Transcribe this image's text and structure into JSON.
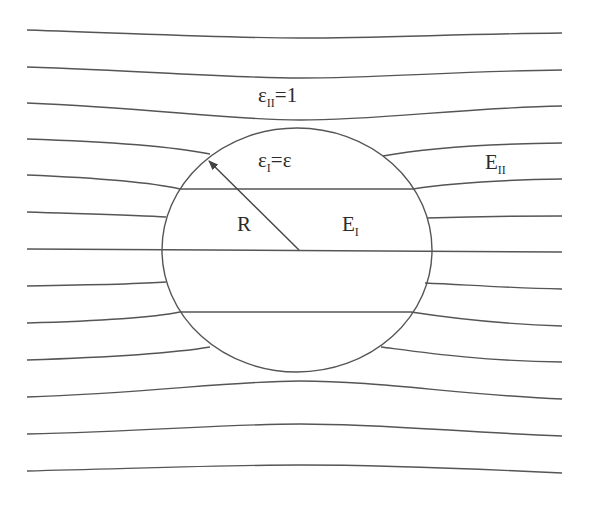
{
  "labels": {
    "outer_medium": {
      "base": "ε",
      "sub": "II",
      "rest": "=1"
    },
    "inner_medium": {
      "base": "ε",
      "sub": "I",
      "rest": "=ε"
    },
    "outer_field": {
      "base": "E",
      "sub": "II"
    },
    "inner_field": {
      "base": "E",
      "sub": "I"
    },
    "radius": "R"
  },
  "colors": {
    "line": "#555555",
    "text": "#2b2b2b",
    "background": "#ffffff"
  }
}
